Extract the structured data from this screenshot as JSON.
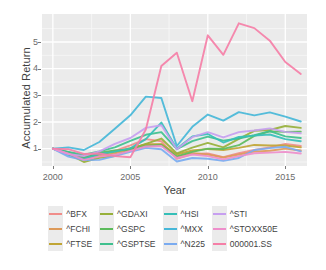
{
  "chart_data": {
    "type": "line",
    "title": "",
    "xlabel": "Year",
    "ylabel": "Accumulated Return",
    "xlim": [
      1999.3,
      2016.4
    ],
    "ylim": [
      0.35,
      6.05
    ],
    "xticks": [
      2000,
      2005,
      2010,
      2015
    ],
    "yticks": [
      1,
      2,
      3,
      4,
      5
    ],
    "grid": true,
    "legend_position": "bottom",
    "x": [
      2000,
      2001,
      2002,
      2003,
      2004,
      2005,
      2006,
      2007,
      2008,
      2009,
      2010,
      2011,
      2012,
      2013,
      2014,
      2015,
      2016
    ],
    "series": [
      {
        "name": "^BFX",
        "color": "#f08d8a",
        "values": [
          1.0,
          0.83,
          0.66,
          0.78,
          0.92,
          1.12,
          1.36,
          1.28,
          0.62,
          0.8,
          0.82,
          0.68,
          0.83,
          0.95,
          1.05,
          1.18,
          1.1
        ]
      },
      {
        "name": "^FCHI",
        "color": "#dd9a5a",
        "values": [
          1.0,
          0.82,
          0.61,
          0.72,
          0.82,
          1.0,
          1.17,
          1.16,
          0.69,
          0.83,
          0.78,
          0.67,
          0.78,
          0.89,
          0.92,
          1.0,
          0.93
        ]
      },
      {
        "name": "^FTSE",
        "color": "#c0a535",
        "values": [
          1.0,
          0.86,
          0.7,
          0.8,
          0.88,
          1.02,
          1.15,
          1.17,
          0.78,
          0.93,
          0.99,
          0.95,
          1.03,
          1.14,
          1.12,
          1.12,
          1.05
        ]
      },
      {
        "name": "^GDAXI",
        "color": "#97b03a",
        "values": [
          1.0,
          0.8,
          0.5,
          0.66,
          0.72,
          0.97,
          1.18,
          1.38,
          0.82,
          1.04,
          1.22,
          1.05,
          1.37,
          1.67,
          1.7,
          1.85,
          1.78
        ]
      },
      {
        "name": "^GSPC",
        "color": "#5cbb5c",
        "values": [
          1.0,
          0.87,
          0.67,
          0.85,
          0.93,
          0.97,
          1.1,
          1.14,
          0.71,
          0.88,
          1.0,
          0.99,
          1.13,
          1.48,
          1.65,
          1.63,
          1.64
        ]
      },
      {
        "name": "^GSPTSE",
        "color": "#3fc08e",
        "values": [
          1.0,
          0.88,
          0.77,
          0.9,
          1.05,
          1.29,
          1.52,
          1.62,
          0.98,
          1.28,
          1.45,
          1.3,
          1.38,
          1.51,
          1.66,
          1.46,
          1.4
        ]
      },
      {
        "name": "^HSI",
        "color": "#35bfb8",
        "values": [
          1.0,
          0.77,
          0.62,
          0.8,
          0.89,
          1.01,
          1.36,
          1.98,
          1.0,
          1.46,
          1.55,
          1.23,
          1.44,
          1.49,
          1.53,
          1.36,
          1.28
        ]
      },
      {
        "name": "^MXX",
        "color": "#46b7d8",
        "values": [
          1.0,
          1.05,
          0.95,
          1.25,
          1.75,
          2.25,
          2.95,
          2.9,
          1.1,
          1.82,
          2.28,
          2.05,
          2.37,
          2.25,
          2.36,
          2.2,
          2.02
        ]
      },
      {
        "name": "^N225",
        "color": "#7aabf0",
        "values": [
          1.0,
          0.7,
          0.57,
          0.58,
          0.72,
          0.88,
          1.03,
          0.98,
          0.52,
          0.65,
          0.62,
          0.54,
          0.65,
          0.95,
          1.02,
          1.07,
          0.9
        ]
      },
      {
        "name": "^STI",
        "color": "#c79ff0",
        "values": [
          1.0,
          0.8,
          0.72,
          0.9,
          1.18,
          1.4,
          1.78,
          1.88,
          0.98,
          1.43,
          1.62,
          1.42,
          1.62,
          1.68,
          1.76,
          1.63,
          1.58
        ]
      },
      {
        "name": "^STOXX50E",
        "color": "#ee8ecb",
        "values": [
          1.0,
          0.81,
          0.58,
          0.7,
          0.77,
          0.92,
          1.08,
          1.1,
          0.65,
          0.78,
          0.72,
          0.6,
          0.72,
          0.83,
          0.85,
          0.88,
          0.82
        ]
      },
      {
        "name": "000001.SS",
        "color": "#f57fa7",
        "values": [
          1.0,
          0.98,
          0.8,
          0.82,
          0.72,
          0.68,
          1.72,
          4.1,
          4.6,
          2.78,
          5.25,
          4.52,
          5.7,
          5.52,
          5.05,
          4.25,
          3.8
        ]
      }
    ]
  },
  "axes": {
    "y_title": "Accumulated Return",
    "x_title": "Year",
    "y_tick_labels": [
      "5",
      "4",
      "3",
      "2",
      "1"
    ],
    "x_tick_labels": [
      "2000",
      "2005",
      "2010",
      "2015"
    ]
  },
  "legend": {
    "items": [
      {
        "label": "^BFX",
        "color": "#f08d8a"
      },
      {
        "label": "^FCHI",
        "color": "#dd9a5a"
      },
      {
        "label": "^FTSE",
        "color": "#c0a535"
      },
      {
        "label": "^GDAXI",
        "color": "#97b03a"
      },
      {
        "label": "^GSPC",
        "color": "#5cbb5c"
      },
      {
        "label": "^GSPTSE",
        "color": "#3fc08e"
      },
      {
        "label": "^HSI",
        "color": "#35bfb8"
      },
      {
        "label": "^MXX",
        "color": "#46b7d8"
      },
      {
        "label": "^N225",
        "color": "#7aabf0"
      },
      {
        "label": "^STI",
        "color": "#c79ff0"
      },
      {
        "label": "^STOXX50E",
        "color": "#ee8ecb"
      },
      {
        "label": "000001.SS",
        "color": "#f57fa7"
      }
    ]
  },
  "style": {
    "panel_background": "#ebebeb",
    "grid_major": "#ffffff",
    "grid_minor": "#f7f7f7",
    "text_color": "#3f3f3f"
  }
}
